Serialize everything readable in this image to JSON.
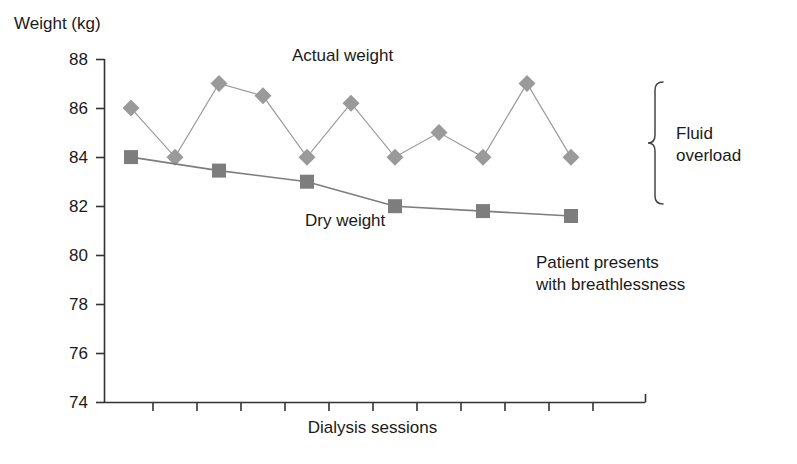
{
  "chart_data": {
    "type": "line",
    "title": "",
    "xlabel": "Dialysis sessions",
    "ylabel": "Weight (kg)",
    "ylim": [
      74,
      88
    ],
    "yticks": [
      88,
      86,
      84,
      82,
      80,
      78,
      76,
      74
    ],
    "ytick_labels": [
      "88",
      "86",
      "84",
      "82",
      "80",
      "78",
      "76",
      "74"
    ],
    "xticks_count": 12,
    "xtick_labels": [],
    "grid": false,
    "legend_position": "inline-annotation",
    "series": [
      {
        "name": "Actual weight",
        "marker": "diamond",
        "color": "#9a9a9a",
        "x_index": [
          0,
          1,
          2,
          3,
          4,
          5,
          6,
          7,
          8,
          9,
          10
        ],
        "values": [
          86.0,
          84.0,
          87.0,
          86.5,
          84.0,
          86.2,
          84.0,
          85.0,
          84.0,
          87.0,
          84.0,
          86.2
        ]
      },
      {
        "name": "Dry weight",
        "marker": "square",
        "color": "#7d7d7d",
        "x_index": [
          0,
          2,
          4,
          6,
          8,
          10
        ],
        "values": [
          84.0,
          83.45,
          83.0,
          82.0,
          81.8,
          81.6
        ]
      }
    ],
    "annotations": [
      {
        "text": "Actual weight",
        "kind": "series-label"
      },
      {
        "text": "Dry weight",
        "kind": "series-label"
      },
      {
        "text": "Fluid overload",
        "kind": "brace-label"
      },
      {
        "text": "Patient presents with breathlessness",
        "kind": "note"
      }
    ]
  },
  "labels": {
    "y_axis_title": "Weight (kg)",
    "x_axis_title": "Dialysis sessions",
    "actual_weight": "Actual weight",
    "dry_weight": "Dry weight",
    "fluid_line1": "Fluid",
    "fluid_line2": "overload",
    "breath_line1": "Patient presents",
    "breath_line2": "with breathlessness",
    "tick_88": "88",
    "tick_86": "86",
    "tick_84": "84",
    "tick_82": "82",
    "tick_80": "80",
    "tick_78": "78",
    "tick_76": "76",
    "tick_74": "74"
  },
  "colors": {
    "axis": "#333333",
    "actual_series": "#a0a0a0",
    "dry_series": "#7a7a7a",
    "text": "#1a1a1a"
  }
}
